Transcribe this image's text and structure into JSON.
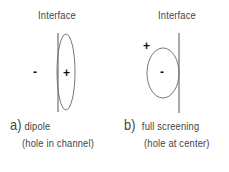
{
  "panels": [
    {
      "id": "a",
      "title": "Interface",
      "caption_letter": "a)",
      "caption": "dipole",
      "subcaption": "(hole in channel)",
      "outside_sign": "-",
      "inside_sign": "+"
    },
    {
      "id": "b",
      "title": "Interface",
      "caption_letter": "b)",
      "caption": "full screening",
      "subcaption": "(hole at center)",
      "outside_sign": "+",
      "inside_sign": "-"
    }
  ],
  "colors": {
    "line": "#555555",
    "text": "#444444"
  }
}
